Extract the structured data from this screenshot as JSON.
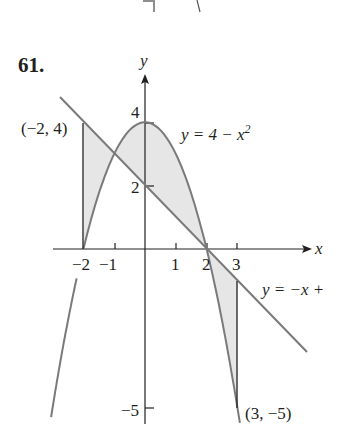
{
  "problem": {
    "number": "61."
  },
  "axes": {
    "x_label": "x",
    "y_label": "y",
    "x_ticks": [
      {
        "value": -2,
        "label": "−2"
      },
      {
        "value": -1,
        "label": "−1"
      },
      {
        "value": 1,
        "label": "1"
      },
      {
        "value": 2,
        "label": "2"
      },
      {
        "value": 3,
        "label": "3"
      }
    ],
    "y_ticks": [
      {
        "value": 4,
        "label": "4"
      },
      {
        "value": 2,
        "label": "2"
      },
      {
        "value": -5,
        "label": "−5"
      }
    ]
  },
  "curves": {
    "parabola_label_main": "y = 4 − x",
    "parabola_label_exp": "2",
    "line_label": "y = −x +"
  },
  "points": {
    "left": "(−2, 4)",
    "right": "(3, −5)"
  },
  "colors": {
    "curve": "#7a7a7a",
    "axis": "#231f20",
    "shade": "#e6e6e6"
  },
  "chart_data": {
    "type": "area",
    "title": "61.",
    "xlabel": "x",
    "ylabel": "y",
    "xlim": [
      -2.8,
      5.0
    ],
    "ylim": [
      -5.5,
      5.3
    ],
    "grid": false,
    "series": [
      {
        "name": "y = 4 − x^2",
        "kind": "parabola",
        "points": [
          [
            -3,
            -5
          ],
          [
            -2,
            0
          ],
          [
            -1,
            3
          ],
          [
            0,
            4
          ],
          [
            1,
            3
          ],
          [
            2,
            0
          ],
          [
            3,
            -5
          ]
        ]
      },
      {
        "name": "y = −x + 2",
        "kind": "line",
        "points": [
          [
            -2.7,
            4.7
          ],
          [
            -2,
            4
          ],
          [
            -1,
            3
          ],
          [
            0,
            2
          ],
          [
            2,
            0
          ],
          [
            3,
            -1
          ],
          [
            5,
            -3
          ]
        ]
      }
    ],
    "shaded_regions": [
      {
        "x_from": -2,
        "x_to": 2,
        "between": [
          "y = 4 − x^2",
          "y = −x + 2"
        ]
      },
      {
        "x_from": 2,
        "x_to": 3,
        "between": [
          "y = −x + 2",
          "y = 4 − x^2"
        ]
      }
    ],
    "intersections": [
      [
        -1,
        3
      ],
      [
        2,
        0
      ]
    ],
    "annotations": [
      "(−2, 4)",
      "(3, −5)",
      "y = 4 − x^2",
      "y = −x +"
    ]
  }
}
